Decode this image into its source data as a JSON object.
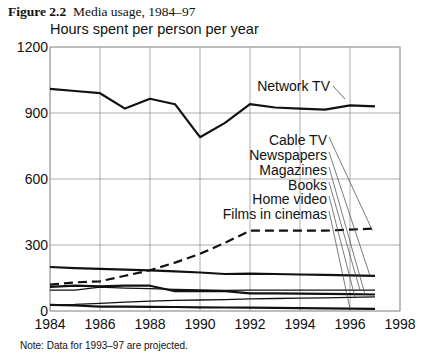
{
  "figure": {
    "number": "Figure 2.2",
    "caption": "Media usage, 1984–97",
    "note": "Note: Data for 1993–97 are projected."
  },
  "chart_data": {
    "type": "line",
    "title": "Media usage, 1984–97",
    "xlabel": "",
    "ylabel": "Hours spent per person per year",
    "xlim": [
      1984,
      1998
    ],
    "ylim": [
      0,
      1200
    ],
    "xticks": [
      1984,
      1986,
      1988,
      1990,
      1992,
      1994,
      1996,
      1998
    ],
    "yticks": [
      0,
      300,
      600,
      900,
      1200
    ],
    "grid": true,
    "legend": "direct labels with leader lines",
    "x": [
      1984,
      1985,
      1986,
      1987,
      1988,
      1989,
      1990,
      1991,
      1992,
      1993,
      1994,
      1995,
      1996,
      1997
    ],
    "series": [
      {
        "name": "Network TV",
        "style": "solid-thick",
        "values": [
          1010,
          1000,
          990,
          920,
          965,
          940,
          790,
          855,
          940,
          925,
          920,
          915,
          935,
          930
        ]
      },
      {
        "name": "Cable TV",
        "style": "dashed",
        "values": [
          120,
          130,
          135,
          160,
          185,
          220,
          260,
          310,
          365,
          365,
          365,
          365,
          370,
          375
        ]
      },
      {
        "name": "Newspapers",
        "style": "solid-thick",
        "values": [
          200,
          195,
          192,
          188,
          185,
          180,
          175,
          168,
          170,
          168,
          166,
          164,
          162,
          160
        ]
      },
      {
        "name": "Magazines",
        "style": "solid-thick",
        "values": [
          110,
          115,
          112,
          115,
          115,
          90,
          90,
          90,
          80,
          80,
          79,
          78,
          77,
          75
        ]
      },
      {
        "name": "Books",
        "style": "solid",
        "values": [
          95,
          95,
          108,
          104,
          102,
          98,
          96,
          94,
          95,
          95,
          95,
          95,
          95,
          95
        ]
      },
      {
        "name": "Home video",
        "style": "solid",
        "values": [
          28,
          30,
          35,
          40,
          45,
          48,
          50,
          52,
          55,
          57,
          58,
          60,
          62,
          64
        ]
      },
      {
        "name": "Films in cinemas",
        "style": "solid-thick",
        "values": [
          28,
          25,
          20,
          20,
          19,
          18,
          17,
          16,
          15,
          14,
          13,
          12,
          11,
          10
        ]
      }
    ]
  }
}
